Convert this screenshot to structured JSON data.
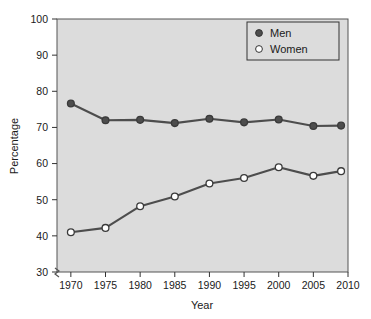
{
  "chart_data": {
    "type": "line",
    "title": "",
    "xlabel": "Year",
    "ylabel": "Percentage",
    "xlim": [
      1968,
      2010
    ],
    "ylim": [
      30,
      100
    ],
    "xticks": [
      1970,
      1975,
      1980,
      1985,
      1990,
      1995,
      2000,
      2005,
      2010
    ],
    "yticks": [
      30,
      40,
      50,
      60,
      70,
      80,
      90,
      100
    ],
    "grid": false,
    "axis_break": true,
    "legend_position": "top-right",
    "x": [
      1970,
      1975,
      1980,
      1985,
      1990,
      1995,
      2000,
      2005,
      2009
    ],
    "series": [
      {
        "name": "Men",
        "marker": "filled-circle",
        "color": "#4d4d4d",
        "values": [
          76.6,
          72.0,
          72.1,
          71.2,
          72.4,
          71.4,
          72.2,
          70.4,
          70.5
        ]
      },
      {
        "name": "Women",
        "marker": "open-circle",
        "color": "#4d4d4d",
        "values": [
          41.0,
          42.2,
          48.2,
          50.9,
          54.5,
          56.0,
          59.0,
          56.6,
          57.9
        ]
      }
    ]
  },
  "legend": {
    "entries": [
      {
        "label": "Men",
        "marker": "filled-circle"
      },
      {
        "label": "Women",
        "marker": "open-circle"
      }
    ]
  },
  "axes": {
    "y_title": "Percentage",
    "x_title": "Year",
    "y_tick_labels": [
      "100",
      "90",
      "80",
      "70",
      "60",
      "50",
      "40",
      "30"
    ],
    "x_tick_labels": [
      "1970",
      "1975",
      "1980",
      "1985",
      "1990",
      "1995",
      "2000",
      "2005",
      "2010"
    ]
  },
  "colors": {
    "panel_background": "#dcdcdc",
    "page_background": "#ffffff",
    "line": "#4d4d4d",
    "axis": "#1a1a1a",
    "marker_fill_men": "#4d4d4d",
    "marker_fill_women": "#ffffff"
  }
}
